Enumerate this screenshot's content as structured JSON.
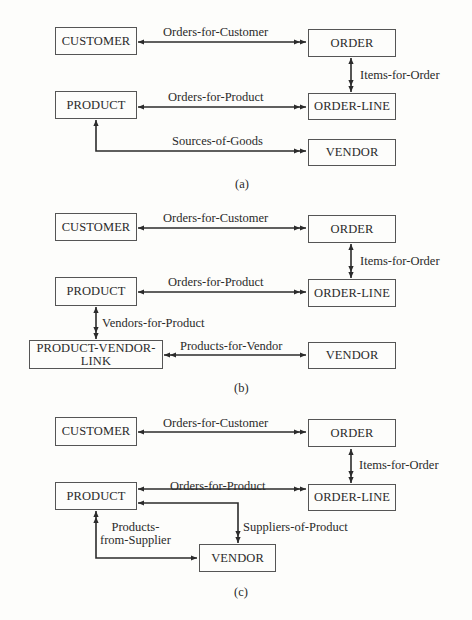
{
  "diagrams": [
    {
      "caption": "(a)",
      "entities": [
        {
          "id": "customer",
          "label": "CUSTOMER",
          "x": 55,
          "y": 27,
          "w": 82,
          "h": 28
        },
        {
          "id": "order",
          "label": "ORDER",
          "x": 308,
          "y": 29,
          "w": 88,
          "h": 28
        },
        {
          "id": "product",
          "label": "PRODUCT",
          "x": 55,
          "y": 91,
          "w": 82,
          "h": 28
        },
        {
          "id": "order-line",
          "label": "ORDER-LINE",
          "x": 308,
          "y": 93,
          "w": 88,
          "h": 27
        },
        {
          "id": "vendor",
          "label": "VENDOR",
          "x": 308,
          "y": 139,
          "w": 88,
          "h": 27
        }
      ],
      "relationships": [
        {
          "label": "Orders-for-Customer",
          "lx": 163,
          "ly": 26,
          "path": [
            [
              138,
              42
            ],
            [
              306,
              42
            ]
          ],
          "one_end": "start",
          "many_end": "end"
        },
        {
          "label": "Items-for-Order",
          "lx": 360,
          "ly": 69,
          "path": [
            [
              351,
              58
            ],
            [
              351,
              92
            ]
          ],
          "one_end": "start",
          "many_end": "end"
        },
        {
          "label": "Orders-for-Product",
          "lx": 168,
          "ly": 91,
          "path": [
            [
              138,
              107
            ],
            [
              306,
              107
            ]
          ],
          "one_end": "start",
          "many_end": "end"
        },
        {
          "label": "Sources-of-Goods",
          "lx": 172,
          "ly": 135,
          "path": [
            [
              96,
              120
            ],
            [
              96,
              151
            ],
            [
              306,
              151
            ]
          ],
          "one_end": "start",
          "many_end": "end"
        }
      ]
    },
    {
      "caption": "(b)",
      "entities": [
        {
          "id": "customer",
          "label": "CUSTOMER",
          "x": 55,
          "y": 213,
          "w": 82,
          "h": 28
        },
        {
          "id": "order",
          "label": "ORDER",
          "x": 308,
          "y": 215,
          "w": 88,
          "h": 28
        },
        {
          "id": "product",
          "label": "PRODUCT",
          "x": 55,
          "y": 277,
          "w": 82,
          "h": 29
        },
        {
          "id": "order-line",
          "label": "ORDER-LINE",
          "x": 308,
          "y": 279,
          "w": 88,
          "h": 28
        },
        {
          "id": "product-vendor-link",
          "label": "PRODUCT-VENDOR-\nLINK",
          "x": 29,
          "y": 340,
          "w": 134,
          "h": 29
        },
        {
          "id": "vendor",
          "label": "VENDOR",
          "x": 308,
          "y": 342,
          "w": 88,
          "h": 27
        }
      ],
      "relationships": [
        {
          "label": "Orders-for-Customer",
          "lx": 163,
          "ly": 212,
          "path": [
            [
              138,
              228
            ],
            [
              306,
              228
            ]
          ],
          "one_end": "start",
          "many_end": "end"
        },
        {
          "label": "Items-for-Order",
          "lx": 360,
          "ly": 255,
          "path": [
            [
              351,
              244
            ],
            [
              351,
              278
            ]
          ],
          "one_end": "start",
          "many_end": "end"
        },
        {
          "label": "Orders-for-Product",
          "lx": 168,
          "ly": 276,
          "path": [
            [
              138,
              292
            ],
            [
              306,
              292
            ]
          ],
          "one_end": "start",
          "many_end": "end"
        },
        {
          "label": "Vendors-for-Product",
          "lx": 102,
          "ly": 317,
          "path": [
            [
              96,
              307
            ],
            [
              96,
              339
            ]
          ],
          "one_end": "start",
          "many_end": "end"
        },
        {
          "label": "Products-for-Vendor",
          "lx": 180,
          "ly": 340,
          "path": [
            [
              306,
              355
            ],
            [
              164,
              355
            ]
          ],
          "one_end": "start",
          "many_end": "end"
        }
      ]
    },
    {
      "caption": "(c)",
      "entities": [
        {
          "id": "customer",
          "label": "CUSTOMER",
          "x": 55,
          "y": 417,
          "w": 82,
          "h": 29
        },
        {
          "id": "order",
          "label": "ORDER",
          "x": 308,
          "y": 419,
          "w": 88,
          "h": 28
        },
        {
          "id": "product",
          "label": "PRODUCT",
          "x": 55,
          "y": 482,
          "w": 82,
          "h": 28
        },
        {
          "id": "order-line",
          "label": "ORDER-LINE",
          "x": 308,
          "y": 484,
          "w": 88,
          "h": 27
        },
        {
          "id": "vendor",
          "label": "VENDOR",
          "x": 199,
          "y": 544,
          "w": 77,
          "h": 28
        }
      ],
      "relationships": [
        {
          "label": "Orders-for-Customer",
          "lx": 163,
          "ly": 417,
          "path": [
            [
              138,
              432
            ],
            [
              306,
              432
            ]
          ],
          "one_end": "start",
          "many_end": "end"
        },
        {
          "label": "Items-for-Order",
          "lx": 359,
          "ly": 459,
          "path": [
            [
              351,
              449
            ],
            [
              351,
              483
            ]
          ],
          "one_end": "start",
          "many_end": "end"
        },
        {
          "label": "Orders-for-Product",
          "lx": 170,
          "ly": 480,
          "path": [
            [
              138,
              489
            ],
            [
              306,
              489
            ]
          ],
          "one_end": "start",
          "many_end": "end"
        },
        {
          "label": "Suppliers-of-Product",
          "lx": 243,
          "ly": 521,
          "path": [
            [
              138,
              503
            ],
            [
              238,
              503
            ],
            [
              238,
              543
            ]
          ],
          "one_end": "start",
          "many_end": "end"
        },
        {
          "label": "Products-\nfrom-Supplier",
          "lx": 100,
          "ly": 521,
          "multi": true,
          "path": [
            [
              197,
              558
            ],
            [
              96,
              558
            ],
            [
              96,
              511
            ]
          ],
          "one_end": "start",
          "many_end": "end"
        }
      ]
    }
  ],
  "caption_positions": [
    {
      "x": 235,
      "y": 177
    },
    {
      "x": 234,
      "y": 381
    },
    {
      "x": 234,
      "y": 585
    }
  ],
  "colors": {
    "line": "#2b2b2b",
    "box_border": "#555555",
    "background": "#fdfdfb",
    "text": "#2a2a2a"
  }
}
